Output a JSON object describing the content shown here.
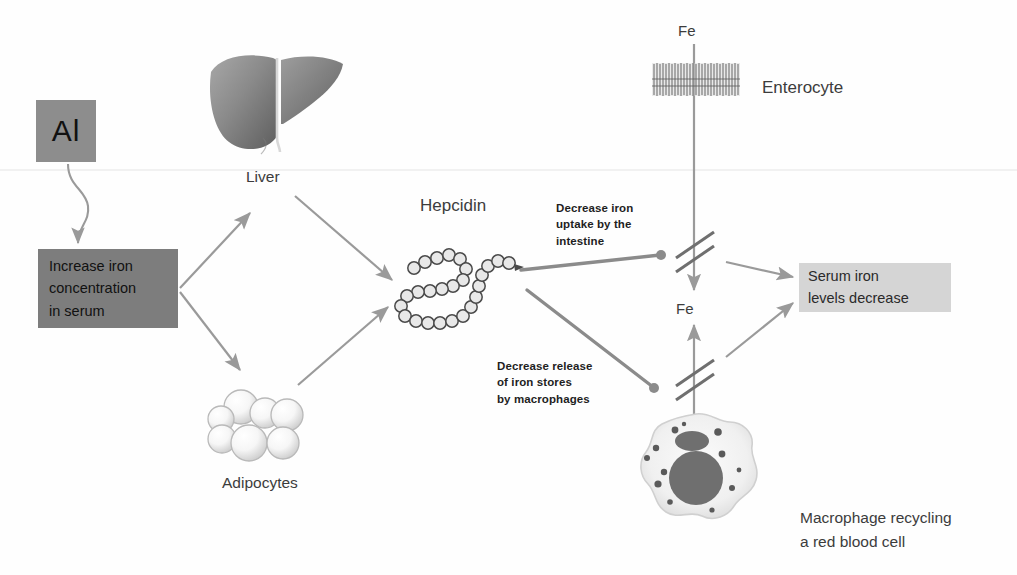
{
  "diagram": {
    "nodes": {
      "al": "Al",
      "increase_iron": "Increase iron concentration in serum",
      "increase_iron_lines": [
        "Increase iron",
        "concentration",
        "in serum"
      ],
      "serum_decrease_lines": [
        "Serum iron",
        "levels decrease"
      ],
      "liver": "Liver",
      "adipocytes": "Adipocytes",
      "hepcidin": "Hepcidin",
      "enterocyte": "Enterocyte",
      "macrophage_lines": [
        "Macrophage recycling",
        "a red blood cell"
      ],
      "fe_top": "Fe",
      "fe_mid": "Fe"
    },
    "inhibition": {
      "intestine_lines": [
        "Decrease iron",
        "uptake by the",
        "intestine"
      ],
      "macrophage_lines": [
        "Decrease release",
        "of iron stores",
        "by macrophages"
      ]
    },
    "colors": {
      "al_box_fill": "#8d8d8d",
      "increase_box_fill": "#7d7d7d",
      "serum_box_fill": "#d5d5d5",
      "arrow_gray": "#9a9a9a",
      "inhibitor_gray": "#8b8b8b",
      "text_dark": "#3a3a3a",
      "liver_gray": "#8c8c8c",
      "macrophage_nucleus": "#6f6f6f",
      "background": "#fefefe"
    },
    "icons": {
      "liver": "liver-organ-icon",
      "adipocytes": "adipocyte-cluster-icon",
      "hepcidin": "peptide-chain-icon",
      "enterocyte": "microvilli-brush-border-icon",
      "macrophage": "macrophage-cell-icon"
    }
  }
}
